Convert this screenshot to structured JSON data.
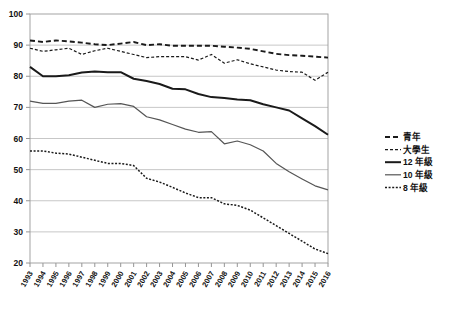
{
  "chart_data": {
    "type": "line",
    "title": "",
    "subtitle": "",
    "xlabel": "",
    "ylabel": "",
    "xlim": [
      1993,
      2016
    ],
    "ylim": [
      20,
      100
    ],
    "ytick_step": 10,
    "yticks": [
      20,
      30,
      40,
      50,
      60,
      70,
      80,
      90,
      100
    ],
    "grid": true,
    "legend_position": "right",
    "x": [
      1993,
      1994,
      1995,
      1996,
      1997,
      1998,
      1999,
      2000,
      2001,
      2002,
      2003,
      2004,
      2005,
      2006,
      2007,
      2008,
      2009,
      2010,
      2011,
      2012,
      2013,
      2014,
      2015,
      2016
    ],
    "categories": [
      "1993",
      "1994",
      "1995",
      "1996",
      "1997",
      "1998",
      "1999",
      "2000",
      "2001",
      "2002",
      "2003",
      "2004",
      "2005",
      "2006",
      "2007",
      "2008",
      "2009",
      "2010",
      "2011",
      "2012",
      "2013",
      "2014",
      "2015",
      "2016"
    ],
    "series": [
      {
        "name": "青年",
        "style": "dashed",
        "color": "#1a1a1a",
        "width": 1.9,
        "dasharray": "5,3",
        "values": [
          91.5,
          91.0,
          91.5,
          91.2,
          90.8,
          90.3,
          90.0,
          90.5,
          91.0,
          90.0,
          90.3,
          89.8,
          89.8,
          89.8,
          89.8,
          89.5,
          89.2,
          88.8,
          88.0,
          87.2,
          86.8,
          86.6,
          86.3,
          86.0
        ]
      },
      {
        "name": "大學生",
        "style": "fine-dashed",
        "color": "#1a1a1a",
        "width": 1.2,
        "dasharray": "3,2",
        "values": [
          89.0,
          88.0,
          88.5,
          89.0,
          87.0,
          88.2,
          89.0,
          88.0,
          87.0,
          86.0,
          86.3,
          86.3,
          86.3,
          85.2,
          87.0,
          84.2,
          85.3,
          84.0,
          83.0,
          82.0,
          81.5,
          81.3,
          78.7,
          81.3
        ]
      },
      {
        "name": "12 年級",
        "style": "solid-bold",
        "color": "#1a1a1a",
        "width": 2.0,
        "dasharray": "",
        "values": [
          83.0,
          80.0,
          80.0,
          80.3,
          81.2,
          81.5,
          81.3,
          81.3,
          79.2,
          78.5,
          77.5,
          76.0,
          75.8,
          74.3,
          73.3,
          73.0,
          72.5,
          72.3,
          71.0,
          70.0,
          69.0,
          66.5,
          64.0,
          61.2
        ]
      },
      {
        "name": "10 年級",
        "style": "solid-thin",
        "color": "#555555",
        "width": 1.2,
        "dasharray": "",
        "values": [
          72.0,
          71.3,
          71.3,
          72.0,
          72.3,
          70.0,
          71.0,
          71.2,
          70.3,
          67.0,
          66.0,
          64.5,
          63.0,
          62.0,
          62.2,
          58.3,
          59.2,
          58.0,
          56.0,
          52.0,
          49.3,
          47.0,
          44.8,
          43.5
        ]
      },
      {
        "name": "8 年級",
        "style": "dotted",
        "color": "#1a1a1a",
        "width": 1.5,
        "dasharray": "2,1.6",
        "values": [
          56.0,
          56.0,
          55.3,
          55.0,
          54.0,
          53.0,
          52.0,
          52.0,
          51.3,
          47.2,
          46.0,
          44.3,
          42.5,
          41.0,
          41.0,
          39.0,
          38.5,
          37.0,
          34.5,
          32.0,
          29.5,
          27.0,
          24.5,
          23.0
        ]
      }
    ],
    "legend": [
      {
        "label": "青年",
        "dash": "5,3",
        "width": 1.9,
        "color": "#1a1a1a"
      },
      {
        "label": "大學生",
        "dash": "3,2",
        "width": 1.2,
        "color": "#1a1a1a"
      },
      {
        "label": "12 年級",
        "dash": "",
        "width": 2.0,
        "color": "#1a1a1a"
      },
      {
        "label": "10 年級",
        "dash": "",
        "width": 1.2,
        "color": "#555555"
      },
      {
        "label": "8 年級",
        "dash": "2,1.6",
        "width": 1.5,
        "color": "#1a1a1a"
      }
    ]
  }
}
